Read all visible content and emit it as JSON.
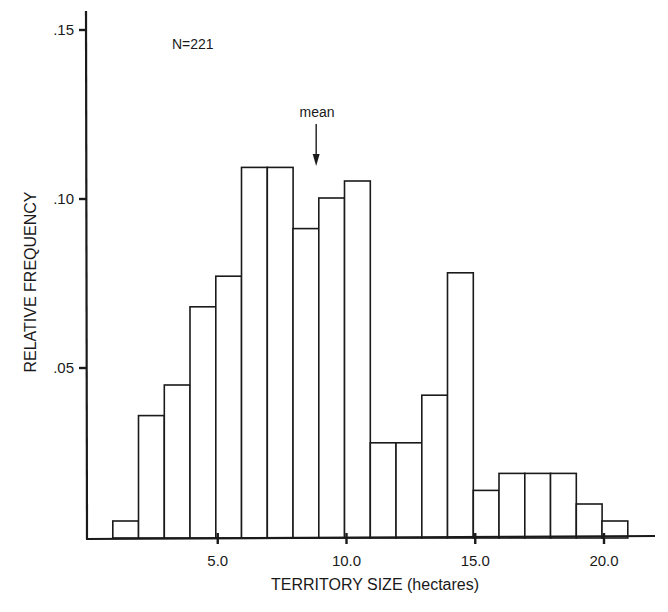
{
  "chart_data": {
    "type": "bar",
    "subtype": "histogram",
    "title": "",
    "xlabel": "TERRITORY SIZE (hectares)",
    "ylabel": "RELATIVE FREQUENCY",
    "annotation_n": "N=221",
    "mean_label": "mean",
    "mean_value": 8.9,
    "bin_width": 1.0,
    "bin_edges": [
      1,
      2,
      3,
      4,
      5,
      6,
      7,
      8,
      9,
      10,
      11,
      12,
      13,
      14,
      15,
      16,
      17,
      18,
      19,
      20,
      21
    ],
    "categories": [
      "1-2",
      "2-3",
      "3-4",
      "4-5",
      "5-6",
      "6-7",
      "7-8",
      "8-9",
      "9-10",
      "10-11",
      "11-12",
      "12-13",
      "13-14",
      "14-15",
      "15-16",
      "16-17",
      "17-18",
      "18-19",
      "19-20",
      "20-21"
    ],
    "values": [
      0.005,
      0.036,
      0.045,
      0.068,
      0.077,
      0.109,
      0.109,
      0.091,
      0.1,
      0.105,
      0.028,
      0.028,
      0.042,
      0.078,
      0.014,
      0.019,
      0.019,
      0.019,
      0.01,
      0.005
    ],
    "x_ticks": [
      5.0,
      10.0,
      15.0,
      20.0
    ],
    "x_tick_labels": [
      "5.0",
      "10.0",
      "15.0",
      "20.0"
    ],
    "y_ticks": [
      0.05,
      0.1,
      0.15
    ],
    "y_tick_labels": [
      ".05",
      ".10",
      ".15"
    ],
    "xlim": [
      -1.1,
      23.9
    ],
    "ylim": [
      0,
      0.155
    ],
    "grid": false,
    "legend": "none"
  }
}
